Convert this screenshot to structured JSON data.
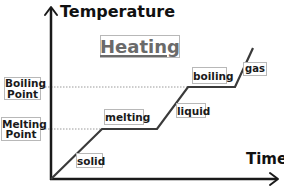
{
  "diagram": {
    "title": "Heating",
    "y_axis_label": "Temperature",
    "x_axis_label": "Time",
    "reference_levels": [
      {
        "label_line1": "Boiling",
        "label_line2": "Point"
      },
      {
        "label_line1": "Melting",
        "label_line2": "Point"
      }
    ],
    "segment_labels": {
      "solid": "solid",
      "melting": "melting",
      "liquid": "liquid",
      "boiling": "boiling",
      "gas": "gas"
    },
    "colors": {
      "axis": "#1a1a1a",
      "curve": "#3a3a3a",
      "dotted_line": "#9a9a9a",
      "label_border": "#b8b8b8",
      "title_text": "#6a6a6a"
    }
  }
}
